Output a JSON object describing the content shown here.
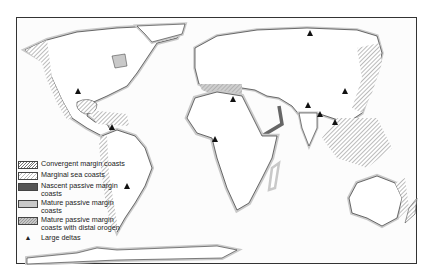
{
  "map": {
    "title": "World coast classification",
    "legend": [
      {
        "key": "convergent",
        "label": "Convergent margin coasts",
        "swatch": "diagonal-hatch"
      },
      {
        "key": "marginal",
        "label": "Marginal sea coasts",
        "swatch": "light-hatch"
      },
      {
        "key": "nascent",
        "label": "Nascent passive margin coasts",
        "swatch": "dark-fill",
        "color": "#555555"
      },
      {
        "key": "mature",
        "label": "Mature passive margin coasts",
        "swatch": "light-gray-fill",
        "color": "#c9c9c9"
      },
      {
        "key": "mature_distal",
        "label": "Mature passive margin coasts with distal orogen",
        "swatch": "gray-hatch"
      },
      {
        "key": "deltas",
        "label": "Large deltas",
        "symbol": "▲"
      }
    ],
    "colors": {
      "frame": "#333333",
      "land_outline": "#333333",
      "mature_band": "#c9c9c9",
      "nascent_band": "#666666",
      "hatch": "#777777"
    }
  }
}
